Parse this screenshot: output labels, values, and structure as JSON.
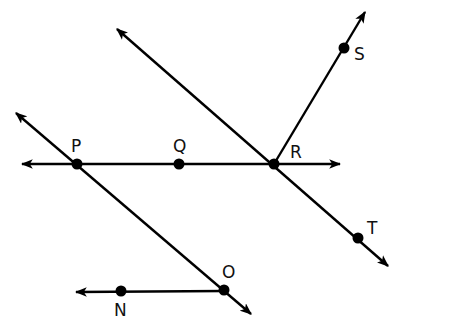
{
  "diagram": {
    "type": "geometry-lines-rays",
    "stroke_color": "#000000",
    "points": [
      {
        "name": "P",
        "x": 77,
        "y": 164,
        "label": "P",
        "lx": 71,
        "ly": 152
      },
      {
        "name": "Q",
        "x": 179,
        "y": 164,
        "label": "Q",
        "lx": 173,
        "ly": 152
      },
      {
        "name": "R",
        "x": 274,
        "y": 164,
        "label": "R",
        "lx": 290,
        "ly": 158
      },
      {
        "name": "S",
        "x": 344,
        "y": 48,
        "label": "S",
        "lx": 354,
        "ly": 60
      },
      {
        "name": "T",
        "x": 358,
        "y": 238,
        "label": "T",
        "lx": 367,
        "ly": 234
      },
      {
        "name": "O",
        "x": 224,
        "y": 290,
        "label": "O",
        "lx": 222,
        "ly": 278
      },
      {
        "name": "N",
        "x": 121,
        "y": 291,
        "label": "N",
        "lx": 114,
        "ly": 316
      }
    ],
    "lines": [
      {
        "id": "line-PQR",
        "x1": 22,
        "y1": 164,
        "x2": 340,
        "y2": 164,
        "arrow_start": true,
        "arrow_end": true
      },
      {
        "id": "line-through-R-T",
        "x1": 117,
        "y1": 29,
        "x2": 388,
        "y2": 266,
        "arrow_start": true,
        "arrow_end": true
      },
      {
        "id": "line-through-P-O",
        "x1": 16,
        "y1": 113,
        "x2": 251,
        "y2": 314,
        "arrow_start": true,
        "arrow_end": true
      },
      {
        "id": "ray-RS",
        "x1": 274,
        "y1": 164,
        "x2": 365,
        "y2": 12,
        "arrow_start": false,
        "arrow_end": true
      },
      {
        "id": "ray-ON",
        "x1": 224,
        "y1": 291,
        "x2": 76,
        "y2": 292,
        "arrow_start": false,
        "arrow_end": true
      }
    ]
  }
}
